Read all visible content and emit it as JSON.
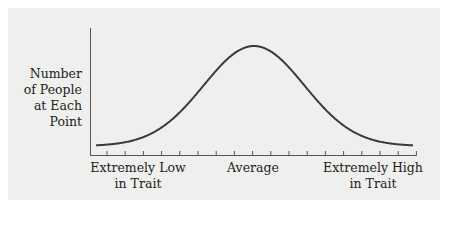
{
  "chart_data": {
    "type": "line",
    "title": "",
    "xlabel": "",
    "ylabel": "Number of People at Each Point",
    "ylabel_lines": [
      "Number",
      "of People",
      "at Each Point"
    ],
    "x_tick_labels": [
      {
        "position": "left",
        "lines": [
          "Extremely Low",
          "in Trait"
        ]
      },
      {
        "position": "center",
        "lines": [
          "Average"
        ]
      },
      {
        "position": "right",
        "lines": [
          "Extremely High",
          "in Trait"
        ]
      }
    ],
    "x_tick_count": 18,
    "series": [
      {
        "name": "Normal distribution",
        "shape": "bell curve (normal distribution)",
        "x": [
          -3,
          -2.5,
          -2,
          -1.5,
          -1,
          -0.5,
          0,
          0.5,
          1,
          1.5,
          2,
          2.5,
          3
        ],
        "values": [
          0.004,
          0.018,
          0.054,
          0.13,
          0.242,
          0.352,
          0.399,
          0.352,
          0.242,
          0.13,
          0.054,
          0.018,
          0.004
        ]
      }
    ],
    "grid": false,
    "legend": null
  },
  "colors": {
    "panel_background": "#efefed",
    "page_background": "#ffffff",
    "curve": "#3a3a3a",
    "axis": "#555555",
    "text": "#222222"
  },
  "labels": {
    "y_line1": "Number",
    "y_line2": "of People",
    "y_line3": "at Each Point",
    "x_left": "Extremely Low\nin Trait",
    "x_center": "Average",
    "x_right": "Extremely High\nin Trait"
  }
}
